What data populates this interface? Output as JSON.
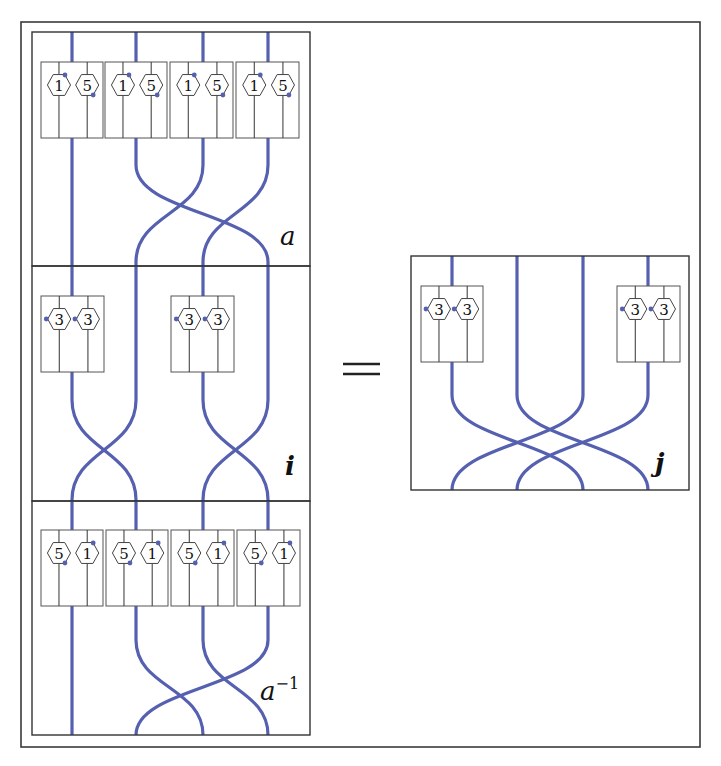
{
  "colors": {
    "strand": "#5560b0",
    "dot": "#5560b0",
    "frame": "#3a3a3a"
  },
  "diagram": {
    "outer_frame": {
      "x": 21,
      "y": 22,
      "w": 679,
      "h": 725
    },
    "equals_sign": "=",
    "left_stack": {
      "x": 32,
      "w": 278,
      "strand_x": [
        72,
        136,
        203,
        268
      ],
      "panels": [
        {
          "id": "a",
          "label": "a",
          "label_sup": "",
          "bold": false,
          "y": 32,
          "h": 234,
          "label_pos": {
            "x": 280,
            "y": 245
          },
          "boxes": [
            {
              "x": 41,
              "y": 62,
              "w": 62,
              "h": 76,
              "hexes": [
                {
                  "label": "1",
                  "dot": "top-right"
                },
                {
                  "label": "5",
                  "dot": "bottom-right"
                }
              ]
            },
            {
              "x": 105,
              "y": 62,
              "w": 62,
              "h": 76,
              "hexes": [
                {
                  "label": "1",
                  "dot": "top-right"
                },
                {
                  "label": "5",
                  "dot": "bottom-right"
                }
              ]
            },
            {
              "x": 170,
              "y": 62,
              "w": 63,
              "h": 76,
              "hexes": [
                {
                  "label": "1",
                  "dot": "top-right"
                },
                {
                  "label": "5",
                  "dot": "bottom-right"
                }
              ]
            },
            {
              "x": 236,
              "y": 62,
              "w": 63,
              "h": 76,
              "hexes": [
                {
                  "label": "1",
                  "dot": "top-right"
                },
                {
                  "label": "5",
                  "dot": "bottom-right"
                }
              ]
            }
          ],
          "permutation": [
            0,
            3,
            1,
            2
          ],
          "box_strands": [
            0,
            1,
            2,
            3
          ],
          "cross_y": [
            165,
            262
          ]
        },
        {
          "id": "i",
          "label": "i",
          "label_sup": "",
          "bold": true,
          "y": 266,
          "h": 235,
          "label_pos": {
            "x": 285,
            "y": 475
          },
          "boxes": [
            {
              "x": 41,
              "y": 296,
              "w": 63,
              "h": 76,
              "hexes": [
                {
                  "label": "3",
                  "dot": "left"
                },
                {
                  "label": "3",
                  "dot": "left"
                }
              ]
            },
            {
              "x": 171,
              "y": 296,
              "w": 63,
              "h": 76,
              "hexes": [
                {
                  "label": "3",
                  "dot": "left"
                },
                {
                  "label": "3",
                  "dot": "left"
                }
              ]
            }
          ],
          "permutation": [
            1,
            0,
            3,
            2
          ],
          "box_strands": [
            0,
            2
          ],
          "cross_y": [
            400,
            500
          ]
        },
        {
          "id": "a_inv",
          "label": "a",
          "label_sup": "−1",
          "bold": false,
          "y": 501,
          "h": 234,
          "label_pos": {
            "x": 260,
            "y": 700
          },
          "boxes": [
            {
              "x": 41,
              "y": 530,
              "w": 62,
              "h": 76,
              "hexes": [
                {
                  "label": "5",
                  "dot": "bottom-right"
                },
                {
                  "label": "1",
                  "dot": "top-right"
                }
              ]
            },
            {
              "x": 106,
              "y": 530,
              "w": 62,
              "h": 76,
              "hexes": [
                {
                  "label": "5",
                  "dot": "bottom-right"
                },
                {
                  "label": "1",
                  "dot": "top-right"
                }
              ]
            },
            {
              "x": 171,
              "y": 530,
              "w": 63,
              "h": 76,
              "hexes": [
                {
                  "label": "5",
                  "dot": "bottom-right"
                },
                {
                  "label": "1",
                  "dot": "top-right"
                }
              ]
            },
            {
              "x": 237,
              "y": 530,
              "w": 63,
              "h": 76,
              "hexes": [
                {
                  "label": "5",
                  "dot": "bottom-right"
                },
                {
                  "label": "1",
                  "dot": "top-right"
                }
              ]
            }
          ],
          "permutation": [
            0,
            2,
            3,
            1
          ],
          "box_strands": [
            0,
            1,
            2,
            3
          ],
          "cross_y": [
            640,
            735
          ]
        }
      ]
    },
    "right_panel": {
      "id": "j",
      "label": "j",
      "bold": true,
      "x": 411,
      "y": 256,
      "w": 278,
      "h": 234,
      "label_pos": {
        "x": 655,
        "y": 472
      },
      "strand_x": [
        452,
        517,
        583,
        648
      ],
      "boxes": [
        {
          "x": 421,
          "y": 286,
          "w": 62,
          "h": 76,
          "hexes": [
            {
              "label": "3",
              "dot": "left"
            },
            {
              "label": "3",
              "dot": "left"
            }
          ]
        },
        {
          "x": 617,
          "y": 286,
          "w": 63,
          "h": 76,
          "hexes": [
            {
              "label": "3",
              "dot": "left"
            },
            {
              "label": "3",
              "dot": "left"
            }
          ]
        }
      ],
      "box_strands": [
        0,
        3
      ],
      "permutation": [
        2,
        3,
        0,
        1
      ],
      "cross_y": [
        395,
        490
      ]
    }
  }
}
